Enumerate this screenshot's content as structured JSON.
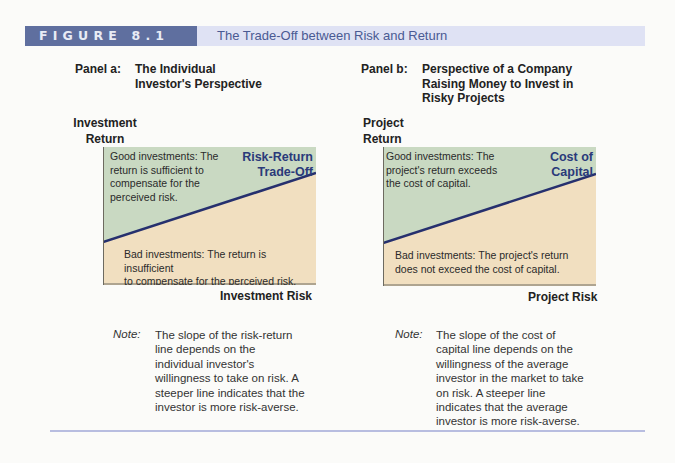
{
  "figure": {
    "label": "FIGURE 8.1",
    "title": "The Trade-Off between Risk and Return",
    "colors": {
      "header_dark": "#5f6f9f",
      "header_light": "#dfe2f4",
      "good_region": "#c9d9c2",
      "bad_region": "#f1dfc0",
      "line": "#26306e",
      "line_label": "#2a3a7a"
    }
  },
  "panel_a": {
    "label": "Panel a:",
    "title_line1": "The Individual",
    "title_line2": "Investor's Perspective",
    "y_axis_line1": "Investment",
    "y_axis_line2": "Return",
    "x_axis": "Investment Risk",
    "line_label_line1": "Risk-Return",
    "line_label_line2": "Trade-Off",
    "good_text": "Good investments: The return is sufficient to compensate for the perceived risk.",
    "good_lines": [
      "Good investments:  The",
      "return is sufficient to",
      "compensate for the",
      "perceived risk."
    ],
    "bad_lines": [
      "Bad investments:  The return is insufficient",
      "to compensate for the perceived risk."
    ],
    "note_key": "Note:",
    "note_lines": [
      "The slope of the risk-return",
      "line depends on the",
      "individual investor's",
      "willingness to take on risk. A",
      "steeper line indicates that the",
      "investor is more risk-averse."
    ]
  },
  "panel_b": {
    "label": "Panel b:",
    "title_line1": "Perspective of a Company",
    "title_line2": "Raising Money to Invest in",
    "title_line3": "Risky Projects",
    "y_axis_line1": "Project",
    "y_axis_line2": "Return",
    "x_axis": "Project Risk",
    "line_label_line1": "Cost of",
    "line_label_line2": "Capital",
    "good_lines": [
      "Good investments:  The",
      "project's return exceeds",
      "the cost of capital."
    ],
    "bad_lines": [
      "Bad investments:  The project's return",
      "does not exceed the cost of capital."
    ],
    "note_key": "Note:",
    "note_lines": [
      "The slope of the cost of",
      "capital line depends on the",
      "willingness of the average",
      "investor in the market to take",
      "on risk. A steeper line",
      "indicates that the average",
      "investor is more risk-averse."
    ]
  }
}
